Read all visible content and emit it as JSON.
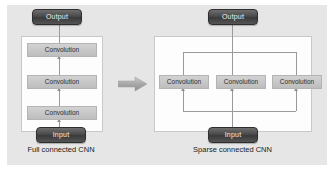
{
  "figure": {
    "background": "#ffffff",
    "plate_color": "#e6e6e6",
    "panel_color": "#fdfdfd",
    "line_color": "#9a9a9a",
    "pill_color": "#4a4a4a",
    "conv_color": "#c6c6c6"
  },
  "left_panel": {
    "caption": "Full connected CNN",
    "output_label": "Output",
    "input_label": "Input",
    "layers": [
      {
        "label": "Convolution"
      },
      {
        "label": "Convolution"
      },
      {
        "label": "Convolution"
      }
    ]
  },
  "transition": {
    "icon": "right-arrow-icon"
  },
  "right_panel": {
    "caption": "Sparse connected CNN",
    "output_label": "Output",
    "input_label": "Input",
    "layers": [
      {
        "label": "Convolution"
      },
      {
        "label": "Convolution"
      },
      {
        "label": "Convolution"
      }
    ]
  }
}
